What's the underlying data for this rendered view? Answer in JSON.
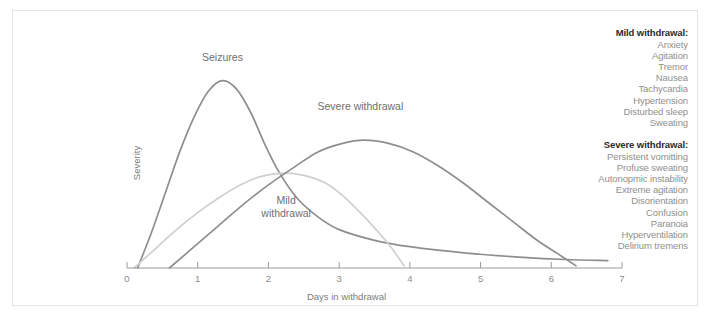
{
  "chart_data": {
    "type": "line",
    "title": "",
    "xlabel": "Days in withdrawal",
    "ylabel": "Severity",
    "xlim": [
      0,
      7
    ],
    "ylim": [
      0,
      1
    ],
    "grid": false,
    "xticks": [
      "0",
      "1",
      "2",
      "3",
      "4",
      "5",
      "6",
      "7"
    ],
    "legend_position": "right",
    "series": [
      {
        "name": "Seizures",
        "color": "#8e8e8e",
        "label_x": 1.35,
        "label_y": 0.97,
        "points": [
          [
            0.15,
            0.0
          ],
          [
            0.35,
            0.17
          ],
          [
            0.55,
            0.36
          ],
          [
            0.75,
            0.55
          ],
          [
            0.95,
            0.71
          ],
          [
            1.15,
            0.83
          ],
          [
            1.35,
            0.88
          ],
          [
            1.55,
            0.84
          ],
          [
            1.75,
            0.73
          ],
          [
            1.95,
            0.58
          ],
          [
            2.15,
            0.45
          ],
          [
            2.4,
            0.33
          ],
          [
            2.7,
            0.24
          ],
          [
            3.0,
            0.18
          ],
          [
            3.5,
            0.13
          ],
          [
            4.0,
            0.1
          ],
          [
            4.8,
            0.07
          ],
          [
            5.6,
            0.05
          ],
          [
            6.2,
            0.04
          ],
          [
            6.8,
            0.035
          ]
        ]
      },
      {
        "name": "Mild withdrawal",
        "color": "#cfcfcf",
        "label_x": 2.25,
        "label_y": 0.3,
        "label_lines": [
          "Mild",
          "withdrawal"
        ],
        "points": [
          [
            0.1,
            0.0
          ],
          [
            0.4,
            0.09
          ],
          [
            0.7,
            0.18
          ],
          [
            1.0,
            0.26
          ],
          [
            1.3,
            0.33
          ],
          [
            1.6,
            0.39
          ],
          [
            1.9,
            0.43
          ],
          [
            2.2,
            0.445
          ],
          [
            2.5,
            0.435
          ],
          [
            2.8,
            0.4
          ],
          [
            3.05,
            0.34
          ],
          [
            3.3,
            0.26
          ],
          [
            3.55,
            0.17
          ],
          [
            3.75,
            0.09
          ],
          [
            3.92,
            0.01
          ]
        ]
      },
      {
        "name": "Severe withdrawal",
        "color": "#8e8e8e",
        "label_x": 3.3,
        "label_y": 0.74,
        "points": [
          [
            0.6,
            0.0
          ],
          [
            0.95,
            0.1
          ],
          [
            1.3,
            0.2
          ],
          [
            1.65,
            0.3
          ],
          [
            2.0,
            0.39
          ],
          [
            2.35,
            0.47
          ],
          [
            2.7,
            0.545
          ],
          [
            3.05,
            0.585
          ],
          [
            3.35,
            0.6
          ],
          [
            3.7,
            0.585
          ],
          [
            4.05,
            0.545
          ],
          [
            4.4,
            0.48
          ],
          [
            4.75,
            0.4
          ],
          [
            5.1,
            0.31
          ],
          [
            5.45,
            0.22
          ],
          [
            5.8,
            0.13
          ],
          [
            6.1,
            0.065
          ],
          [
            6.35,
            0.01
          ]
        ]
      }
    ]
  },
  "legend": [
    {
      "title": "Mild withdrawal:",
      "items": [
        "Anxiety",
        "Agitation",
        "Tremor",
        "Nausea",
        "Tachycardia",
        "Hypertension",
        "Disturbed sleep",
        "Sweating"
      ]
    },
    {
      "title": "Severe withdrawal:",
      "items": [
        "Persistent vomitting",
        "Profuse sweating",
        "Autonopmic instability",
        "Extreme agitation",
        "Disorientation",
        "Confusion",
        "Paranoia",
        "Hyperventilation",
        "Delirium tremens"
      ]
    }
  ]
}
